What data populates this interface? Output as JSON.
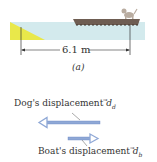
{
  "figure": {
    "distance_label": "6.1 m",
    "panel_label": "(a)",
    "dog_label": "Dog's displacement",
    "dog_vector": "d",
    "dog_sub": "d",
    "boat_label": "Boat's displacement",
    "boat_vector": "d",
    "boat_sub": "b"
  },
  "colors": {
    "water": "#d3eaed",
    "shore": "#e9e84a",
    "boat": "#6e5d52",
    "arrow": "#8fa8d6",
    "arrow_stroke": "#6a86c4"
  }
}
